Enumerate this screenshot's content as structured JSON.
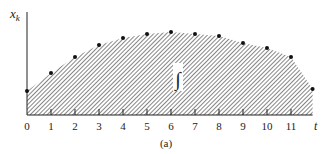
{
  "figure": {
    "caption": "(a)",
    "integral_symbol": "∫",
    "colors": {
      "ink": "#222222",
      "hatch": "#555555",
      "background": "#ffffff"
    }
  },
  "chart_data": {
    "type": "area",
    "title": "",
    "xlabel": "t",
    "ylabel": "x_k",
    "x_ticks": [
      "0",
      "1",
      "2",
      "3",
      "4",
      "5",
      "6",
      "7",
      "8",
      "9",
      "10",
      "11"
    ],
    "x": [
      0,
      1,
      2,
      3,
      4,
      5,
      6,
      7,
      8,
      9,
      10,
      11,
      11.9
    ],
    "values": [
      0.24,
      0.42,
      0.58,
      0.7,
      0.77,
      0.81,
      0.83,
      0.81,
      0.79,
      0.72,
      0.67,
      0.58,
      0.26
    ],
    "xlim": [
      0,
      12
    ],
    "ylim": [
      0,
      1
    ],
    "fill": "hatched",
    "markers": "dots",
    "annotation": "∫ (area under curve)",
    "grid": false,
    "legend": null
  }
}
